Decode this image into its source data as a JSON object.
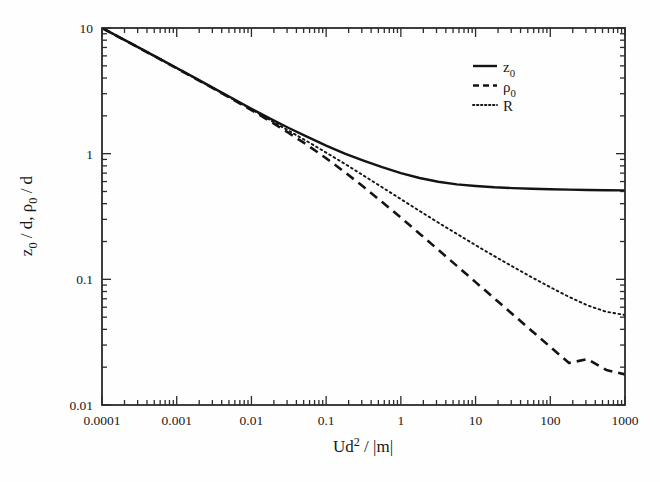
{
  "figure": {
    "background_color": "#fefefe",
    "line_color": "#141414",
    "axis_color": "#2b2b2b"
  },
  "axes": {
    "x": {
      "label_parts": {
        "main": "Ud",
        "exponent": "2",
        "tail": " / |m|"
      },
      "label_text": "Ud2 / |m|",
      "scale": "log",
      "min": 0.0001,
      "max": 1000,
      "ticks": [
        "0.0001",
        "0.001",
        "0.01",
        "0.1",
        "1",
        "10",
        "100",
        "1000"
      ],
      "tick_values": [
        0.0001,
        0.001,
        0.01,
        0.1,
        1,
        10,
        100,
        1000
      ],
      "tick_direction": "in",
      "minor_ticks": true
    },
    "y": {
      "label_parts": {
        "a": "z",
        "a_sub": "0",
        "mid": " / d, ",
        "b": "ρ",
        "b_sub": "0",
        "tail": " / d"
      },
      "label_text": "z0 / d, ρ0 / d",
      "scale": "log",
      "min": 0.01,
      "max": 10,
      "ticks": [
        "0.01",
        "0.1",
        "1",
        "10"
      ],
      "tick_values": [
        0.01,
        0.1,
        1,
        10
      ],
      "tick_direction": "in",
      "minor_ticks": true
    }
  },
  "legend": {
    "position": "top-right-inside",
    "entries": [
      {
        "label": "z0",
        "label_main": "z",
        "label_sub": "0",
        "style": "solid"
      },
      {
        "label": "ρ0",
        "label_main": "ρ",
        "label_sub": "0",
        "style": "dashed"
      },
      {
        "label": "R",
        "label_main": "R",
        "label_sub": "",
        "style": "dotted"
      }
    ]
  },
  "chart_data": {
    "type": "line",
    "title": "",
    "subtitle": "",
    "xlabel": "Ud2 / |m|",
    "ylabel": "z0 / d, ρ0 / d",
    "xscale": "log",
    "yscale": "log",
    "xlim": [
      0.0001,
      1000
    ],
    "ylim": [
      0.01,
      10
    ],
    "grid": false,
    "legend_position": "top right (inside axes)",
    "x": [
      0.0001,
      0.000178,
      0.000316,
      0.000562,
      0.001,
      0.00178,
      0.00316,
      0.00562,
      0.01,
      0.0178,
      0.0316,
      0.0562,
      0.1,
      0.178,
      0.316,
      0.562,
      1.0,
      1.78,
      3.16,
      5.62,
      10.0,
      17.8,
      31.6,
      56.2,
      100.0,
      178.0,
      316.0,
      562.0,
      1000.0,
      1400.0
    ],
    "series": [
      {
        "name": "z0",
        "style": "solid",
        "linewidth": 2.4,
        "values": [
          10.0,
          8.35,
          6.95,
          5.78,
          4.8,
          3.99,
          3.31,
          2.75,
          2.28,
          1.9,
          1.6,
          1.36,
          1.16,
          1.0,
          0.88,
          0.78,
          0.7,
          0.64,
          0.598,
          0.57,
          0.553,
          0.54,
          0.532,
          0.526,
          0.521,
          0.517,
          0.514,
          0.512,
          0.51,
          0.508
        ]
      },
      {
        "name": "ρ0",
        "style": "dashed",
        "linewidth": 2.6,
        "values": [
          10.0,
          8.32,
          6.92,
          5.75,
          4.78,
          3.96,
          3.28,
          2.7,
          2.22,
          1.81,
          1.46,
          1.17,
          0.92,
          0.712,
          0.545,
          0.412,
          0.31,
          0.231,
          0.172,
          0.128,
          0.095,
          0.0706,
          0.0525,
          0.039,
          0.029,
          0.0216,
          0.0232,
          0.019,
          0.0175,
          0.0163
        ]
      },
      {
        "name": "R",
        "style": "dotted",
        "linewidth": 1.9,
        "values": [
          10.0,
          8.33,
          6.93,
          5.76,
          4.79,
          3.97,
          3.29,
          2.72,
          2.25,
          1.85,
          1.52,
          1.25,
          1.02,
          0.83,
          0.67,
          0.54,
          0.435,
          0.35,
          0.283,
          0.23,
          0.187,
          0.153,
          0.126,
          0.104,
          0.0865,
          0.0725,
          0.062,
          0.0552,
          0.052,
          0.05
        ]
      }
    ],
    "annotations": [
      "All three curves coincide at small Ud^2/|m| following a power law of slope about -0.26 in log-log",
      "Curves separate near Ud^2/|m| ~ 0.03",
      "z0 flattens to a plateau near 0.51 for large Ud^2/|m|",
      "rho0 continues decreasing to about 0.016 at the right edge",
      "R continues decreasing to about 0.05 at the right edge"
    ]
  }
}
